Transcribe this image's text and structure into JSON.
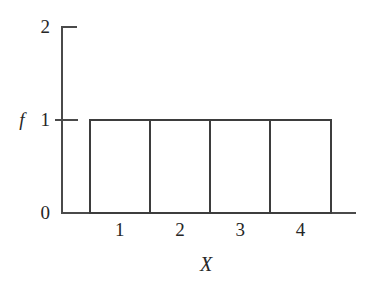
{
  "chart_data": {
    "type": "bar",
    "title": "",
    "subtitle": "",
    "xlabel": "X",
    "ylabel": "f",
    "categories": [
      "1",
      "2",
      "3",
      "4"
    ],
    "values": [
      1,
      1,
      1,
      1
    ],
    "ylim": [
      0,
      2
    ],
    "y_ticks": [
      "0",
      "1",
      "2"
    ],
    "y_tick_values": [
      0,
      1,
      2
    ],
    "x_tick_labels": [
      "1",
      "2",
      "3",
      "4"
    ],
    "grid": false,
    "legend": null,
    "bar_fill": "#ffffff",
    "bar_stroke": "#3d3d3d",
    "axis_color": "#4a4a4a",
    "text_color": "#262626",
    "background": "#ffffff",
    "annotations": []
  },
  "figure": {
    "caption": "",
    "y_axis_label": "f",
    "x_axis_label": "X",
    "tick_top_label": "2",
    "tick_mid_label": "1",
    "tick_zero_label": "0",
    "bar_labels": [
      "1",
      "2",
      "3",
      "4"
    ]
  }
}
